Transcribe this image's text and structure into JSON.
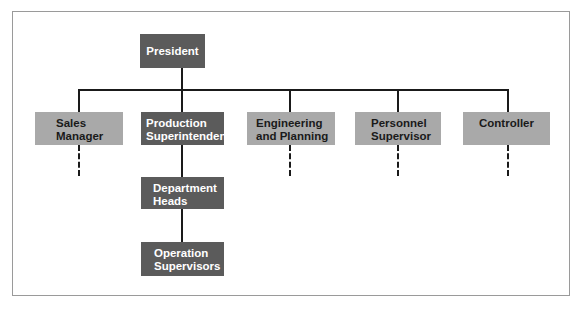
{
  "chart": {
    "type": "org-chart",
    "colors": {
      "executive": "#5b5b5b",
      "staff": "#a9a9a9",
      "lines": "#1a1a1a",
      "frame": "#9a9a9a"
    },
    "top": {
      "label": "President"
    },
    "level2": [
      {
        "line1": "Sales",
        "line2": "Manager"
      },
      {
        "line1": "Production",
        "line2": "Superintendent"
      },
      {
        "line1": "Engineering",
        "line2": "and Planning"
      },
      {
        "line1": "Personnel",
        "line2": "Supervisor"
      },
      {
        "line1": "Controller",
        "line2": ""
      }
    ],
    "production_chain": [
      {
        "line1": "Department",
        "line2": "Heads"
      },
      {
        "line1": "Operation",
        "line2": "Supervisors"
      }
    ]
  }
}
